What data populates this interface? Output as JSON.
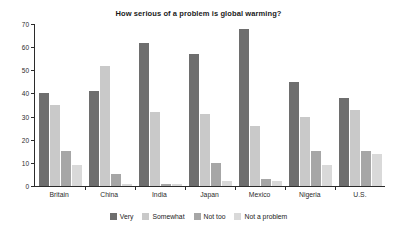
{
  "chart_data": {
    "type": "bar",
    "title": "How serious of a problem is global warming?",
    "xlabel": "",
    "ylabel": "",
    "ylim": [
      0,
      70
    ],
    "yticks": [
      0,
      10,
      20,
      30,
      40,
      50,
      60,
      70
    ],
    "grid": false,
    "legend_position": "bottom",
    "categories": [
      "Britain",
      "China",
      "India",
      "Japan",
      "Mexico",
      "Nigeria",
      "U.S."
    ],
    "series": [
      {
        "name": "Very",
        "color": "#6e6e6e",
        "values": [
          40,
          41,
          62,
          57,
          68,
          45,
          38
        ]
      },
      {
        "name": "Somewhat",
        "color": "#c9c9c9",
        "values": [
          35,
          52,
          32,
          31,
          26,
          30,
          33
        ]
      },
      {
        "name": "Not too",
        "color": "#a6a6a6",
        "values": [
          15,
          5,
          1,
          10,
          3,
          15,
          15
        ]
      },
      {
        "name": "Not a problem",
        "color": "#d9d9d9",
        "values": [
          9,
          1,
          1,
          2,
          2,
          9,
          14
        ]
      }
    ]
  }
}
